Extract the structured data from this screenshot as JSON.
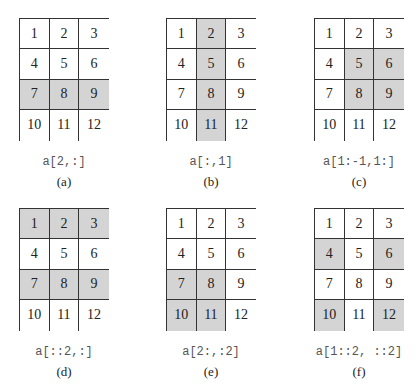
{
  "figure": {
    "values": [
      [
        1,
        2,
        3
      ],
      [
        4,
        5,
        6
      ],
      [
        7,
        8,
        9
      ],
      [
        10,
        11,
        12
      ]
    ],
    "highlight_color": "#d4d4d4",
    "panels": [
      {
        "id": "a",
        "code": "a[2,:]",
        "label": "(a)",
        "highlight": [
          [
            2,
            0
          ],
          [
            2,
            1
          ],
          [
            2,
            2
          ]
        ]
      },
      {
        "id": "b",
        "code": "a[:,1]",
        "label": "(b)",
        "highlight": [
          [
            0,
            1
          ],
          [
            1,
            1
          ],
          [
            2,
            1
          ],
          [
            3,
            1
          ]
        ]
      },
      {
        "id": "c",
        "code": "a[1:-1,1:]",
        "label": "(c)",
        "highlight": [
          [
            1,
            1
          ],
          [
            1,
            2
          ],
          [
            2,
            1
          ],
          [
            2,
            2
          ]
        ]
      },
      {
        "id": "d",
        "code": "a[::2,:]",
        "label": "(d)",
        "highlight": [
          [
            0,
            0
          ],
          [
            0,
            1
          ],
          [
            0,
            2
          ],
          [
            2,
            0
          ],
          [
            2,
            1
          ],
          [
            2,
            2
          ]
        ]
      },
      {
        "id": "e",
        "code": "a[2:,:2]",
        "label": "(e)",
        "highlight": [
          [
            2,
            0
          ],
          [
            2,
            1
          ],
          [
            3,
            0
          ],
          [
            3,
            1
          ]
        ]
      },
      {
        "id": "f",
        "code": "a[1::2, ::2]",
        "label": "(f)",
        "highlight": [
          [
            1,
            0
          ],
          [
            1,
            2
          ],
          [
            3,
            0
          ],
          [
            3,
            2
          ]
        ]
      }
    ]
  }
}
